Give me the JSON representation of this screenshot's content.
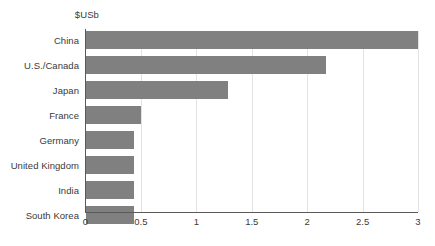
{
  "chart_data": {
    "type": "bar",
    "orientation": "horizontal",
    "title": "",
    "subtitle": "",
    "unit_label": "$USb",
    "xlabel": "",
    "ylabel": "",
    "categories": [
      "China",
      "U.S./Canada",
      "Japan",
      "France",
      "Germany",
      "United Kingdom",
      "India",
      "South Korea"
    ],
    "values": [
      3.0,
      2.17,
      1.29,
      0.5,
      0.44,
      0.44,
      0.44,
      0.44
    ],
    "xlim": [
      0,
      3
    ],
    "xticks": [
      0,
      0.5,
      1,
      1.5,
      2,
      2.5,
      3
    ],
    "xtick_labels": [
      "0",
      "0.5",
      "1",
      "1.5",
      "2",
      "2.5",
      "3"
    ],
    "grid": true,
    "legend": null,
    "series": [
      {
        "name": "",
        "values": [
          3.0,
          2.17,
          1.29,
          0.5,
          0.44,
          0.44,
          0.44,
          0.44
        ],
        "color": "#808080"
      }
    ]
  },
  "style": {
    "bar_color": "#808080",
    "axis_color": "#5a5a5a",
    "grid_color": "#e3e3e3",
    "text_color": "#3a3a3a",
    "background": "#ffffff"
  }
}
